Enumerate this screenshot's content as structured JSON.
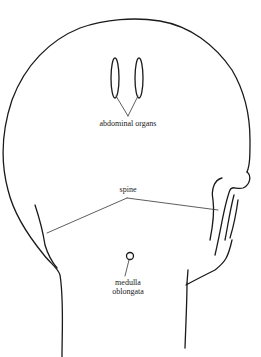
{
  "diagram": {
    "labels": {
      "abdominal_organs": "abdominal organs",
      "spine": "spine",
      "medulla_line1": "medulla",
      "medulla_line2": "oblongata"
    },
    "colors": {
      "line": "#1a1a1a",
      "background": "#ffffff"
    }
  }
}
